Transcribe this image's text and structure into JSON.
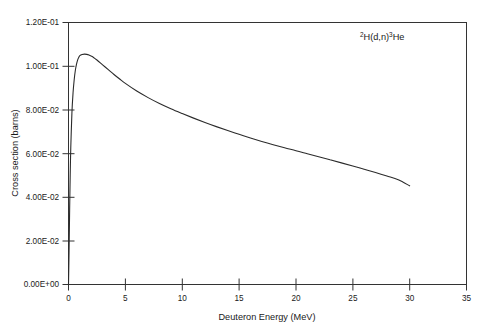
{
  "chart_data": {
    "type": "line",
    "title": "",
    "annotation": {
      "pre_sup": "2",
      "mid": "H(d,n)",
      "post_sup": "3",
      "tail": "He",
      "plain": "2H(d,n)3He"
    },
    "xlabel": "Deuteron Energy (MeV)",
    "ylabel": "Cross section (barns)",
    "xlim": [
      0,
      35
    ],
    "ylim": [
      0,
      0.12
    ],
    "xticks": [
      0,
      5,
      10,
      15,
      20,
      25,
      30,
      35
    ],
    "xtick_labels": [
      "0",
      "5",
      "10",
      "15",
      "20",
      "25",
      "30",
      "35"
    ],
    "yticks": [
      0,
      0.02,
      0.04,
      0.06,
      0.08,
      0.1,
      0.12
    ],
    "ytick_labels": [
      "0.00E+00",
      "2.00E-02",
      "4.00E-02",
      "6.00E-02",
      "8.00E-02",
      "1.00E-01",
      "1.20E-01"
    ],
    "grid": false,
    "legend": "none",
    "series": [
      {
        "name": "2H(d,n)3He cross section",
        "x": [
          0.0,
          0.05,
          0.1,
          0.15,
          0.2,
          0.3,
          0.4,
          0.5,
          0.6,
          0.7,
          0.8,
          0.9,
          1.0,
          1.2,
          1.4,
          1.6,
          1.8,
          2.0,
          2.2,
          2.5,
          3.0,
          3.5,
          4.0,
          4.5,
          5.0,
          6.0,
          7.0,
          8.0,
          9.0,
          10.0,
          11.0,
          12.0,
          13.0,
          14.0,
          15.0,
          16.0,
          17.0,
          18.0,
          19.0,
          20.0,
          21.0,
          22.0,
          23.0,
          24.0,
          25.0,
          26.0,
          27.0,
          28.0,
          29.0,
          30.0
        ],
        "y": [
          0.0,
          0.0155,
          0.0345,
          0.0505,
          0.0625,
          0.0785,
          0.0878,
          0.0938,
          0.098,
          0.1008,
          0.1028,
          0.104,
          0.1048,
          0.1053,
          0.1055,
          0.1054,
          0.1051,
          0.1046,
          0.104,
          0.1028,
          0.1006,
          0.0984,
          0.0962,
          0.0941,
          0.0921,
          0.0886,
          0.0856,
          0.0829,
          0.0805,
          0.0783,
          0.0762,
          0.0742,
          0.0723,
          0.0705,
          0.0688,
          0.0671,
          0.0655,
          0.064,
          0.0626,
          0.0613,
          0.0599,
          0.0585,
          0.0571,
          0.0557,
          0.0543,
          0.0528,
          0.0513,
          0.0497,
          0.048,
          0.0452
        ],
        "color": "#2b2b2b",
        "peak_x": 1.4,
        "peak_y": 0.1055,
        "end_x": 30,
        "end_y": 0.0452
      }
    ]
  }
}
